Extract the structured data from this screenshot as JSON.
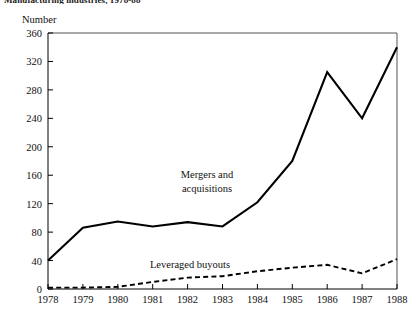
{
  "figure": {
    "title": "Manufacturing industries, 1978-88",
    "y_axis_title": "Number"
  },
  "labels": {
    "series_mergers": "Mergers and acquisitions",
    "series_mergers_line1": "Mergers and",
    "series_mergers_line2": "acquisitions",
    "series_lbo": "Leveraged buyouts"
  },
  "chart_data": {
    "type": "line",
    "title": "Manufacturing industries, 1978-88",
    "xlabel": "",
    "ylabel": "Number",
    "ylim": [
      0,
      360
    ],
    "ytick_step": 40,
    "yticks": [
      0,
      40,
      80,
      120,
      160,
      200,
      240,
      280,
      320,
      360
    ],
    "ytick_labels": [
      "0",
      "40",
      "80",
      "120",
      "160",
      "200",
      "240",
      "280",
      "320",
      "360"
    ],
    "x": [
      1978,
      1979,
      1980,
      1981,
      1982,
      1983,
      1984,
      1985,
      1986,
      1987,
      1988
    ],
    "xtick_labels": [
      "1978",
      "1979",
      "1980",
      "1981",
      "1982",
      "1983",
      "1984",
      "1985",
      "1986",
      "1987",
      "1988"
    ],
    "grid": false,
    "legend_position": "inline-annotation",
    "series": [
      {
        "name": "Mergers and acquisitions",
        "style": "solid",
        "color": "#000000",
        "values": [
          40,
          86,
          95,
          88,
          94,
          88,
          122,
          180,
          305,
          240,
          340
        ]
      },
      {
        "name": "Leveraged buyouts",
        "style": "dashed",
        "color": "#000000",
        "values": [
          2,
          2,
          3,
          10,
          16,
          18,
          25,
          30,
          34,
          22,
          42
        ]
      }
    ]
  }
}
